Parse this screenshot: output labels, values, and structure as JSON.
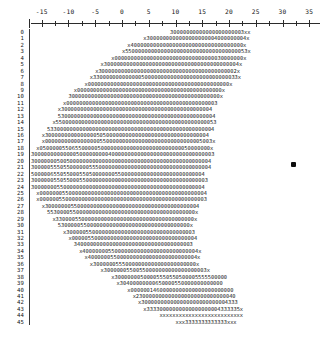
{
  "chart_data": {
    "type": "heatmap",
    "title": "",
    "subtitle": "",
    "xlabel": "",
    "ylabel": "",
    "render_style": "ascii-character-grid",
    "xlim": [
      -17,
      37
    ],
    "ylim": [
      0,
      45
    ],
    "grid": false,
    "legend_position": "none",
    "axis": {
      "position": "top",
      "tick_labels": [
        "-15",
        "-10",
        "-5",
        "0",
        "5",
        "10",
        "15",
        "20",
        "25",
        "30",
        "35"
      ],
      "tick_values": [
        -15,
        -10,
        -5,
        0,
        5,
        10,
        15,
        20,
        25,
        30,
        35
      ],
      "minor_ticks_between": 1,
      "corner_glyph": "|"
    },
    "row_labels": [
      "0",
      "1",
      "2",
      "3",
      "4",
      "5",
      "6",
      "7",
      "8",
      "9",
      "10",
      "11",
      "12",
      "13",
      "14",
      "15",
      "16",
      "17",
      "18",
      "19",
      "20",
      "21",
      "22",
      "23",
      "24",
      "25",
      "26",
      "27",
      "28",
      "29",
      "30",
      "31",
      "32",
      "33",
      "34",
      "35",
      "36",
      "37",
      "38",
      "39",
      "40",
      "41",
      "42",
      "43",
      "44",
      "45"
    ],
    "row_separator": "|",
    "glyph_legend": {
      "0": "level-0",
      "3": "level-3",
      "4": "level-4",
      "5": "level-5",
      "x": "edge-marker"
    },
    "rows": [
      {
        "label": "0",
        "indent": 26,
        "text": "30000000000000000000003xx"
      },
      {
        "label": "1",
        "indent": 21,
        "text": "x3000000000000000000004000000004x"
      },
      {
        "label": "2",
        "indent": 18,
        "text": "x40000000000000000000000000000000000x"
      },
      {
        "label": "3",
        "indent": 17,
        "text": "x55000000000000000000000000000000000053x"
      },
      {
        "label": "4",
        "indent": 15,
        "text": "x0000000000000000000000000000000030000000x"
      },
      {
        "label": "5",
        "indent": 13,
        "text": "x300000000000000000000000000000000000000004x"
      },
      {
        "label": "6",
        "indent": 12,
        "text": "x3000000000000000000000000000000000000000002x"
      },
      {
        "label": "7",
        "indent": 11,
        "text": "x330000000000000500000000000000000000000000033x"
      },
      {
        "label": "8",
        "indent": 10,
        "text": "x00000000000000000000000000000000000000000000x"
      },
      {
        "label": "9",
        "indent": 8,
        "text": "x000000000000000000000000000000000000000000000x"
      },
      {
        "label": "10",
        "indent": 7,
        "text": "30000000000000000000000000000000000000000000000x"
      },
      {
        "label": "11",
        "indent": 6,
        "text": "x00000000000000000000000000000000000000000000003"
      },
      {
        "label": "12",
        "indent": 5,
        "text": "x30000000000000000000000000000000000000000000004"
      },
      {
        "label": "13",
        "indent": 5,
        "text": "5300000000000000000000000000000000000000000000004"
      },
      {
        "label": "14",
        "indent": 4,
        "text": "x55000000000000000000000000000000000000000000000053"
      },
      {
        "label": "15",
        "indent": 3,
        "text": "5330000000000000000000000000000000000000000000000004"
      },
      {
        "label": "16",
        "indent": 2,
        "text": "x300000000000000050500000000000000000000000000000004"
      },
      {
        "label": "17",
        "indent": 2,
        "text": "x0000000000000000055000000000000000000000000000005003x"
      },
      {
        "label": "18",
        "indent": 1,
        "text": "x05000005506550000050000000000000000000000000050000000x"
      },
      {
        "label": "19",
        "indent": 0,
        "text": "300000000000005000000000400000000000000000000000000000003"
      },
      {
        "label": "20",
        "indent": 0,
        "text": "30000000500500000000000000000000000000000000000000000004"
      },
      {
        "label": "21",
        "indent": 0,
        "text": "30000055505500000055500000000000000000000000000000000004"
      },
      {
        "label": "22",
        "indent": 0,
        "text": "500000655055000550500000005500000000000000000000000004"
      },
      {
        "label": "23",
        "indent": 0,
        "text": "3000000550550005500000000000000000000000000000000000003"
      },
      {
        "label": "24",
        "indent": 0,
        "text": "300000005500000000000000000000000000000000000000000004"
      },
      {
        "label": "25",
        "indent": 1,
        "text": "x0000000550000000000000000000000000000000000000000004"
      },
      {
        "label": "26",
        "indent": 1,
        "text": "x0000005500000000000000000000000000000000000000000003"
      },
      {
        "label": "27",
        "indent": 2,
        "text": "x300000005500000000000000000000000000000000000004"
      },
      {
        "label": "28",
        "indent": 3,
        "text": "5530000550000000000000000000000000000000000000x"
      },
      {
        "label": "29",
        "indent": 4,
        "text": "x3300005500000000000000000000000000000000000x"
      },
      {
        "label": "30",
        "indent": 5,
        "text": "53000005500000000000000000000000000000000x"
      },
      {
        "label": "31",
        "indent": 6,
        "text": "x3000005500000000000000000000000000000003"
      },
      {
        "label": "32",
        "indent": 7,
        "text": "x000005500000000000000000000000000000004"
      },
      {
        "label": "33",
        "indent": 8,
        "text": "3400000000000000000000000000000000003"
      },
      {
        "label": "34",
        "indent": 9,
        "text": "x400000005500000000000000000000000004x"
      },
      {
        "label": "35",
        "indent": 10,
        "text": "x4000000550000000000000000000000004x"
      },
      {
        "label": "36",
        "indent": 11,
        "text": "x30000005550000000000000000000000x"
      },
      {
        "label": "37",
        "indent": 13,
        "text": "x30000005500550000000000000000003x"
      },
      {
        "label": "38",
        "indent": 15,
        "text": "x30000000500005550550500005555500000"
      },
      {
        "label": "39",
        "indent": 16,
        "text": "x30400000000650000550000000000000"
      },
      {
        "label": "40",
        "indent": 18,
        "text": "x00000014600000000000000000000000"
      },
      {
        "label": "41",
        "indent": 19,
        "text": "x2300000000000000000000000000040"
      },
      {
        "label": "42",
        "indent": 20,
        "text": "x300000000000000000000000004333"
      },
      {
        "label": "43",
        "indent": 21,
        "text": "x33330000000000000000004333335x"
      },
      {
        "label": "44",
        "indent": 24,
        "text": "xxxxxxxxxxxxxxxxxxxxxxxxxx"
      },
      {
        "label": "45",
        "indent": 27,
        "text": "xxx3333333333333xxx"
      }
    ],
    "cursor_marker": {
      "visible": true,
      "x": 291,
      "y": 162
    }
  }
}
